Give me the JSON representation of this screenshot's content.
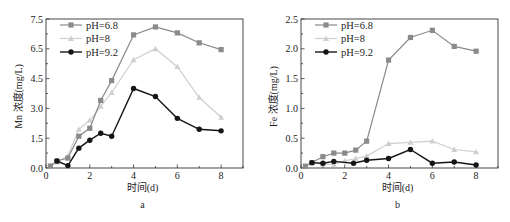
{
  "figure": {
    "panels": [
      {
        "id": "a",
        "caption": "a"
      },
      {
        "id": "b",
        "caption": "b"
      }
    ]
  },
  "series_style": {
    "pH=6.8": {
      "color": "#8a8a8a",
      "marker": "square"
    },
    "pH=8": {
      "color": "#cfcfcf",
      "marker": "triangle"
    },
    "pH=9.2": {
      "color": "#151515",
      "marker": "circle"
    }
  },
  "chart_data": [
    {
      "type": "line",
      "panel": "a",
      "title": "",
      "xlabel": "时间(d)",
      "ylabel": "Mn 浓度(mg/L)",
      "xlim": [
        0,
        9
      ],
      "ylim": [
        0,
        7.5
      ],
      "xticks": [
        0,
        2,
        4,
        6,
        8
      ],
      "yticks": [
        0.0,
        1.5,
        3.0,
        4.5,
        6.0,
        7.5
      ],
      "ytick_labels": [
        "0.0",
        "1.5",
        "3.0",
        "4.5",
        "6.5",
        "7.5"
      ],
      "grid": false,
      "legend_position": "upper left",
      "legend": [
        "pH=6.8",
        "pH=8",
        "pH=9.2"
      ],
      "series": [
        {
          "name": "pH=6.8",
          "x": [
            0.2,
            0.5,
            1,
            1.5,
            2,
            2.5,
            3,
            4,
            5,
            6,
            7,
            8
          ],
          "values": [
            0.1,
            0.35,
            0.5,
            1.6,
            2.0,
            3.4,
            4.4,
            6.7,
            7.1,
            6.8,
            6.3,
            5.96
          ]
        },
        {
          "name": "pH=8",
          "x": [
            0.2,
            0.5,
            1,
            1.5,
            2,
            2.5,
            3,
            4,
            5,
            6,
            7,
            8
          ],
          "values": [
            0.1,
            0.3,
            0.6,
            1.95,
            2.4,
            3.1,
            3.8,
            5.45,
            6.0,
            5.1,
            3.55,
            2.55
          ]
        },
        {
          "name": "pH=9.2",
          "x": [
            0.5,
            1,
            1.5,
            2,
            2.5,
            3,
            4,
            5,
            6,
            7,
            8
          ],
          "values": [
            0.35,
            0.12,
            1.0,
            1.4,
            1.75,
            1.6,
            4.0,
            3.6,
            2.5,
            1.95,
            1.87
          ]
        }
      ]
    },
    {
      "type": "line",
      "panel": "b",
      "title": "",
      "xlabel": "时间(d)",
      "ylabel": "Fe 浓度(mg/L)",
      "xlim": [
        0,
        9
      ],
      "ylim": [
        0,
        2.5
      ],
      "xticks": [
        0,
        2,
        4,
        6,
        8
      ],
      "yticks": [
        0.0,
        0.5,
        1.0,
        1.5,
        2.0,
        2.5
      ],
      "ytick_labels": [
        "0.0",
        "0.5",
        "1.0",
        "1.5",
        "2.0",
        "2.5"
      ],
      "grid": false,
      "legend_position": "upper left",
      "legend": [
        "pH=6.8",
        "pH=8",
        "pH=9.2"
      ],
      "series": [
        {
          "name": "pH=6.8",
          "x": [
            0.2,
            0.5,
            1,
            1.5,
            2,
            2.5,
            3,
            4,
            5,
            6,
            7,
            8
          ],
          "values": [
            0.03,
            0.09,
            0.19,
            0.25,
            0.25,
            0.3,
            0.45,
            1.81,
            2.19,
            2.31,
            2.04,
            1.96
          ]
        },
        {
          "name": "pH=8",
          "x": [
            0.2,
            0.5,
            1,
            1.5,
            2,
            2.5,
            3,
            4,
            5,
            6,
            7,
            8
          ],
          "values": [
            0.03,
            0.09,
            0.06,
            0.06,
            0.12,
            0.16,
            0.2,
            0.41,
            0.43,
            0.45,
            0.31,
            0.27
          ]
        },
        {
          "name": "pH=9.2",
          "x": [
            0.5,
            1,
            1.5,
            2.4,
            3,
            4,
            5,
            6,
            7,
            8
          ],
          "values": [
            0.09,
            0.08,
            0.11,
            0.08,
            0.13,
            0.16,
            0.31,
            0.08,
            0.1,
            0.05
          ]
        }
      ]
    }
  ]
}
